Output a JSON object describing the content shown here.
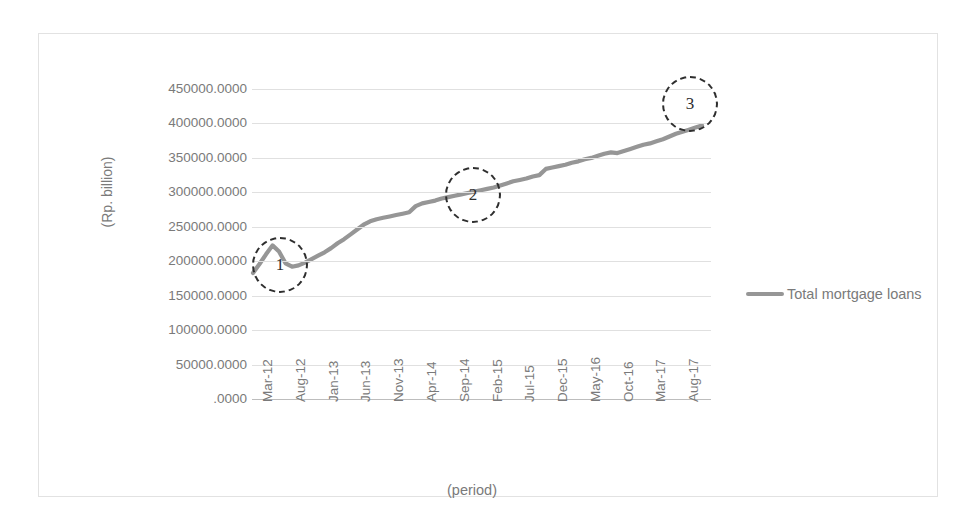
{
  "chart_data": {
    "type": "line",
    "title": "",
    "xlabel": "(period)",
    "ylabel": "(Rp. billion)",
    "ylim": [
      0,
      450000
    ],
    "ytick_labels": [
      "450000.0000",
      "400000.0000",
      "350000.0000",
      "300000.0000",
      "250000.0000",
      "200000.0000",
      "150000.0000",
      "100000.0000",
      "50000.0000",
      ".0000"
    ],
    "ytick_values": [
      450000,
      400000,
      350000,
      300000,
      250000,
      200000,
      150000,
      100000,
      50000,
      0
    ],
    "xtick_labels": [
      "Mar-12",
      "Aug-12",
      "Jan-13",
      "Jun-13",
      "Nov-13",
      "Apr-14",
      "Sep-14",
      "Feb-15",
      "Jul-15",
      "Dec-15",
      "May-16",
      "Oct-16",
      "Mar-17",
      "Aug-17"
    ],
    "grid": true,
    "legend_position": "right",
    "series": [
      {
        "name": "Total mortgage loans",
        "color": "#969696",
        "x": [
          "Mar-12",
          "Apr-12",
          "May-12",
          "Jun-12",
          "Jul-12",
          "Aug-12",
          "Sep-12",
          "Oct-12",
          "Nov-12",
          "Dec-12",
          "Jan-13",
          "Feb-13",
          "Mar-13",
          "Apr-13",
          "May-13",
          "Jun-13",
          "Jul-13",
          "Aug-13",
          "Sep-13",
          "Oct-13",
          "Nov-13",
          "Dec-13",
          "Jan-14",
          "Feb-14",
          "Mar-14",
          "Apr-14",
          "May-14",
          "Jun-14",
          "Jul-14",
          "Aug-14",
          "Sep-14",
          "Oct-14",
          "Nov-14",
          "Dec-14",
          "Jan-15",
          "Feb-15",
          "Mar-15",
          "Apr-15",
          "May-15",
          "Jun-15",
          "Jul-15",
          "Aug-15",
          "Sep-15",
          "Oct-15",
          "Nov-15",
          "Dec-15",
          "Jan-16",
          "Feb-16",
          "Mar-16",
          "Apr-16",
          "May-16",
          "Jun-16",
          "Jul-16",
          "Aug-16",
          "Sep-16",
          "Oct-16",
          "Nov-16",
          "Dec-16",
          "Jan-17",
          "Feb-17",
          "Mar-17",
          "Apr-17",
          "May-17",
          "Jun-17",
          "Jul-17",
          "Aug-17",
          "Sep-17",
          "Oct-17",
          "Nov-17",
          "Dec-17"
        ],
        "values": [
          183000,
          196000,
          210000,
          223000,
          214000,
          197000,
          192000,
          194000,
          198000,
          203000,
          208000,
          213000,
          219000,
          226000,
          232000,
          239000,
          246000,
          253000,
          258000,
          261000,
          263000,
          265000,
          267000,
          269000,
          271000,
          280000,
          284000,
          286000,
          288000,
          291000,
          293000,
          295000,
          297000,
          299000,
          301000,
          303000,
          305000,
          307000,
          310000,
          313000,
          316000,
          318000,
          320000,
          323000,
          325000,
          334000,
          336000,
          338000,
          340000,
          343000,
          345000,
          348000,
          350000,
          353000,
          356000,
          358000,
          357000,
          360000,
          363000,
          366000,
          369000,
          371000,
          374000,
          377000,
          381000,
          385000,
          388000,
          391000,
          394000,
          397000
        ]
      }
    ],
    "annotations": [
      {
        "label": "1",
        "x_approx": "Aug-12",
        "y_approx": 190000,
        "shape": "dashed-circle"
      },
      {
        "label": "2",
        "x_approx": "Jun-15",
        "y_approx": 300000,
        "shape": "dashed-circle"
      },
      {
        "label": "3",
        "x_approx": "Aug-17",
        "y_approx": 388000,
        "shape": "dashed-circle"
      }
    ]
  },
  "legend": {
    "entries": [
      {
        "label": "Total mortgage loans",
        "color": "#969696"
      }
    ]
  }
}
